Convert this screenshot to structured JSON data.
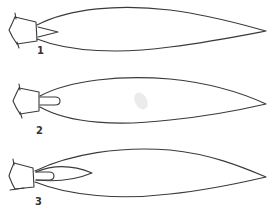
{
  "figure": {
    "background": "#ffffff",
    "stroke_color": "#3a3a3a",
    "flames": [
      {
        "label": "1",
        "inner_cone": "short pointed cone"
      },
      {
        "label": "2",
        "inner_cone": "short rounded cone"
      },
      {
        "label": "3",
        "inner_cone": "rounded cone inside longer pointed cone"
      }
    ]
  }
}
